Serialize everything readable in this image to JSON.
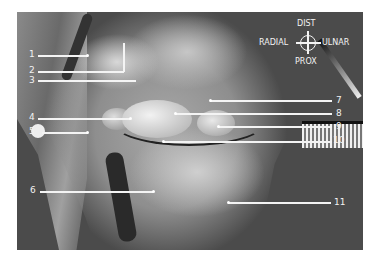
{
  "figure": {
    "background_color": "#4b4b4b",
    "label_color": "#f2f2f2"
  },
  "compass": {
    "top": "DIST",
    "bottom": "PROX",
    "left": "RADIAL",
    "right": "ULNAR"
  },
  "labels": [
    {
      "id": "1",
      "text": "1"
    },
    {
      "id": "2",
      "text": "2"
    },
    {
      "id": "3",
      "text": "3"
    },
    {
      "id": "4",
      "text": "4"
    },
    {
      "id": "5",
      "text": "5"
    },
    {
      "id": "6",
      "text": "6"
    },
    {
      "id": "7",
      "text": "7"
    },
    {
      "id": "8",
      "text": "8"
    },
    {
      "id": "9",
      "text": "9"
    },
    {
      "id": "10",
      "text": "10"
    },
    {
      "id": "11",
      "text": "11"
    }
  ]
}
